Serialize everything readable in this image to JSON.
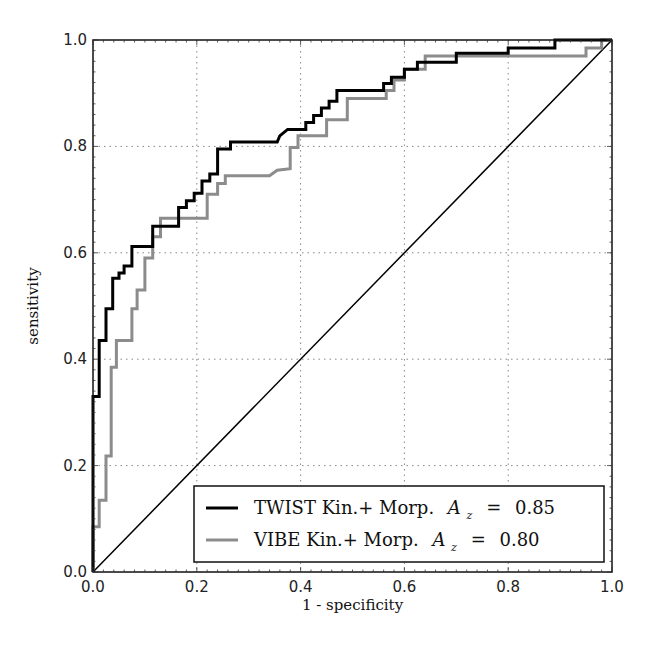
{
  "chart_data": {
    "type": "line",
    "title": "",
    "xlabel": "1 - specificity",
    "ylabel": "sensitivity",
    "xlim": [
      0.0,
      1.0
    ],
    "ylim": [
      0.0,
      1.0
    ],
    "grid": true,
    "legend_position": "lower right",
    "xticks": [
      "0.0",
      "0.2",
      "0.4",
      "0.6",
      "0.8",
      "1.0"
    ],
    "yticks": [
      "0.0",
      "0.2",
      "0.4",
      "0.6",
      "0.8",
      "1.0"
    ],
    "series": [
      {
        "name": "TWIST Kin.+ Morp. A_z = 0.85",
        "label_main": "TWIST Kin.+ Morp.",
        "az_value": "0.85",
        "color": "#000000",
        "line_width": 3,
        "style": "step",
        "points": [
          [
            0.0,
            0.0
          ],
          [
            0.0,
            0.33
          ],
          [
            0.012,
            0.33
          ],
          [
            0.012,
            0.435
          ],
          [
            0.025,
            0.435
          ],
          [
            0.025,
            0.495
          ],
          [
            0.038,
            0.495
          ],
          [
            0.038,
            0.552
          ],
          [
            0.05,
            0.552
          ],
          [
            0.05,
            0.562
          ],
          [
            0.06,
            0.562
          ],
          [
            0.06,
            0.575
          ],
          [
            0.075,
            0.575
          ],
          [
            0.075,
            0.612
          ],
          [
            0.115,
            0.612
          ],
          [
            0.115,
            0.65
          ],
          [
            0.165,
            0.65
          ],
          [
            0.165,
            0.685
          ],
          [
            0.18,
            0.685
          ],
          [
            0.18,
            0.698
          ],
          [
            0.195,
            0.698
          ],
          [
            0.195,
            0.712
          ],
          [
            0.21,
            0.712
          ],
          [
            0.21,
            0.735
          ],
          [
            0.225,
            0.735
          ],
          [
            0.225,
            0.748
          ],
          [
            0.24,
            0.748
          ],
          [
            0.24,
            0.795
          ],
          [
            0.265,
            0.795
          ],
          [
            0.265,
            0.808
          ],
          [
            0.355,
            0.808
          ],
          [
            0.36,
            0.82
          ],
          [
            0.375,
            0.832
          ],
          [
            0.41,
            0.832
          ],
          [
            0.41,
            0.845
          ],
          [
            0.425,
            0.845
          ],
          [
            0.425,
            0.858
          ],
          [
            0.44,
            0.858
          ],
          [
            0.44,
            0.872
          ],
          [
            0.455,
            0.872
          ],
          [
            0.455,
            0.885
          ],
          [
            0.47,
            0.885
          ],
          [
            0.47,
            0.905
          ],
          [
            0.56,
            0.905
          ],
          [
            0.56,
            0.918
          ],
          [
            0.575,
            0.918
          ],
          [
            0.575,
            0.93
          ],
          [
            0.6,
            0.93
          ],
          [
            0.6,
            0.945
          ],
          [
            0.625,
            0.945
          ],
          [
            0.625,
            0.958
          ],
          [
            0.7,
            0.958
          ],
          [
            0.7,
            0.975
          ],
          [
            0.8,
            0.975
          ],
          [
            0.8,
            0.985
          ],
          [
            0.89,
            0.985
          ],
          [
            0.89,
            1.0
          ],
          [
            1.0,
            1.0
          ]
        ]
      },
      {
        "name": "VIBE Kin.+ Morp. A_z = 0.80",
        "label_main": "VIBE Kin.+ Morp.",
        "az_value": "0.80",
        "color": "#8c8c8c",
        "line_width": 3,
        "style": "step",
        "points": [
          [
            0.0,
            0.0
          ],
          [
            0.0,
            0.085
          ],
          [
            0.012,
            0.085
          ],
          [
            0.012,
            0.135
          ],
          [
            0.025,
            0.135
          ],
          [
            0.025,
            0.218
          ],
          [
            0.035,
            0.218
          ],
          [
            0.035,
            0.385
          ],
          [
            0.045,
            0.385
          ],
          [
            0.045,
            0.435
          ],
          [
            0.075,
            0.435
          ],
          [
            0.075,
            0.495
          ],
          [
            0.085,
            0.495
          ],
          [
            0.085,
            0.53
          ],
          [
            0.1,
            0.53
          ],
          [
            0.1,
            0.59
          ],
          [
            0.115,
            0.59
          ],
          [
            0.115,
            0.63
          ],
          [
            0.13,
            0.63
          ],
          [
            0.13,
            0.665
          ],
          [
            0.22,
            0.665
          ],
          [
            0.22,
            0.71
          ],
          [
            0.24,
            0.71
          ],
          [
            0.24,
            0.73
          ],
          [
            0.255,
            0.73
          ],
          [
            0.255,
            0.745
          ],
          [
            0.34,
            0.745
          ],
          [
            0.355,
            0.755
          ],
          [
            0.38,
            0.758
          ],
          [
            0.38,
            0.798
          ],
          [
            0.395,
            0.798
          ],
          [
            0.395,
            0.82
          ],
          [
            0.45,
            0.82
          ],
          [
            0.45,
            0.85
          ],
          [
            0.49,
            0.85
          ],
          [
            0.49,
            0.89
          ],
          [
            0.565,
            0.89
          ],
          [
            0.565,
            0.905
          ],
          [
            0.58,
            0.905
          ],
          [
            0.58,
            0.925
          ],
          [
            0.6,
            0.925
          ],
          [
            0.6,
            0.945
          ],
          [
            0.64,
            0.945
          ],
          [
            0.64,
            0.97
          ],
          [
            0.95,
            0.97
          ],
          [
            0.95,
            0.985
          ],
          [
            0.98,
            0.985
          ],
          [
            0.98,
            1.0
          ],
          [
            1.0,
            1.0
          ]
        ]
      },
      {
        "name": "chance diagonal",
        "color": "#000000",
        "line_width": 1.5,
        "style": "line",
        "points": [
          [
            0.0,
            0.0
          ],
          [
            1.0,
            1.0
          ]
        ]
      }
    ]
  },
  "legend": {
    "entries": [
      {
        "label": "TWIST Kin.+ Morp.",
        "az_symbol": "A",
        "az_sub": "z",
        "equals": "=",
        "value": "0.85",
        "color": "#000000"
      },
      {
        "label": "VIBE Kin.+ Morp.",
        "az_symbol": "A",
        "az_sub": "z",
        "equals": "=",
        "value": "0.80",
        "color": "#8c8c8c"
      }
    ]
  },
  "layout": {
    "plot_left": 93,
    "plot_top": 40,
    "plot_right": 612,
    "plot_bottom": 572,
    "legend_box": {
      "x": 194,
      "y": 486,
      "w": 410,
      "h": 76
    }
  }
}
